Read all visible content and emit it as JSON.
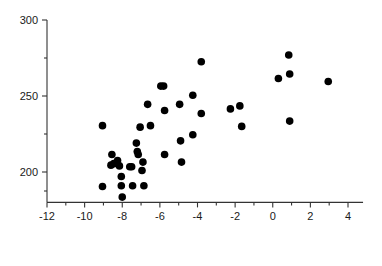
{
  "chart_data": {
    "type": "scatter",
    "title": "",
    "xlabel": "",
    "ylabel": "",
    "xlim": [
      -12,
      4.8
    ],
    "ylim": [
      180,
      300
    ],
    "grid": false,
    "legend": null,
    "xticks": [
      -12,
      -10,
      -8,
      -6,
      -4,
      -2,
      0,
      2,
      4
    ],
    "xtick_labels": [
      "-12",
      "-10",
      "-8",
      "-6",
      "-4",
      "-2",
      "0",
      "2",
      "4"
    ],
    "x_minor_ticks": [
      -11,
      -9,
      -7,
      -5,
      -3,
      -1,
      1,
      3
    ],
    "yticks": [
      200,
      250,
      300
    ],
    "ytick_labels": [
      "200",
      "250",
      "300"
    ],
    "y_minor_ticks": [
      187.5,
      225,
      275
    ],
    "marker": "filled-circle",
    "marker_color": "#000000",
    "marker_size": 5,
    "axis_color": "#333333",
    "points": [
      {
        "x": -9.05,
        "y": 230.5
      },
      {
        "x": -9.05,
        "y": 190.5
      },
      {
        "x": -8.55,
        "y": 211.5
      },
      {
        "x": -8.6,
        "y": 204.5
      },
      {
        "x": -8.45,
        "y": 205.5
      },
      {
        "x": -8.25,
        "y": 207.5
      },
      {
        "x": -8.15,
        "y": 204.0
      },
      {
        "x": -8.05,
        "y": 197.0
      },
      {
        "x": -8.05,
        "y": 191.0
      },
      {
        "x": -8.0,
        "y": 183.5
      },
      {
        "x": -7.6,
        "y": 203.5
      },
      {
        "x": -7.5,
        "y": 203.5
      },
      {
        "x": -7.45,
        "y": 191.0
      },
      {
        "x": -7.25,
        "y": 219.0
      },
      {
        "x": -7.2,
        "y": 213.5
      },
      {
        "x": -7.15,
        "y": 211.5
      },
      {
        "x": -7.05,
        "y": 229.5
      },
      {
        "x": -6.95,
        "y": 201.0
      },
      {
        "x": -6.9,
        "y": 206.5
      },
      {
        "x": -6.85,
        "y": 191.0
      },
      {
        "x": -6.65,
        "y": 244.5
      },
      {
        "x": -6.5,
        "y": 230.5
      },
      {
        "x": -5.95,
        "y": 256.5
      },
      {
        "x": -5.8,
        "y": 256.5
      },
      {
        "x": -5.75,
        "y": 240.5
      },
      {
        "x": -5.75,
        "y": 211.5
      },
      {
        "x": -4.95,
        "y": 244.5
      },
      {
        "x": -4.9,
        "y": 220.5
      },
      {
        "x": -4.85,
        "y": 206.5
      },
      {
        "x": -4.25,
        "y": 250.5
      },
      {
        "x": -4.25,
        "y": 224.5
      },
      {
        "x": -3.8,
        "y": 272.5
      },
      {
        "x": -3.8,
        "y": 238.5
      },
      {
        "x": -2.25,
        "y": 241.5
      },
      {
        "x": -1.75,
        "y": 243.5
      },
      {
        "x": -1.65,
        "y": 230.0
      },
      {
        "x": 0.3,
        "y": 261.5
      },
      {
        "x": 0.85,
        "y": 277.0
      },
      {
        "x": 0.9,
        "y": 264.5
      },
      {
        "x": 0.9,
        "y": 233.5
      },
      {
        "x": 2.95,
        "y": 259.5
      }
    ]
  },
  "axes": {
    "x_axis_name": "x-axis",
    "y_axis_name": "y-axis"
  }
}
